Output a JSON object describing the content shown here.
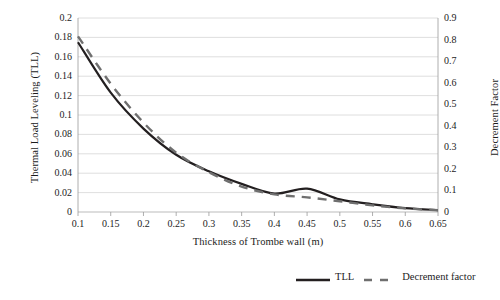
{
  "chart_data": {
    "type": "line",
    "title": "",
    "xlabel": "Thickness of Trombe wall (m)",
    "ylabel": "Thermal Load Leveling (TLL)",
    "y2label": "Decrement Factor",
    "xlim": [
      0.1,
      0.65
    ],
    "ylim": [
      0,
      0.2
    ],
    "y2lim": [
      0,
      0.9
    ],
    "grid": true,
    "legend_position": "bottom-right",
    "xticks": [
      "0.1",
      "0.15",
      "0.2",
      "0.25",
      "0.3",
      "0.35",
      "0.4",
      "0.45",
      "0.5",
      "0.55",
      "0.6",
      "0.65"
    ],
    "yticks_left": [
      "0",
      "0.02",
      "0.04",
      "0.06",
      "0.08",
      "0.1",
      "0.12",
      "0.14",
      "0.16",
      "0.18",
      "0.2"
    ],
    "yticks_right": [
      "0",
      "0.1",
      "0.2",
      "0.3",
      "0.4",
      "0.5",
      "0.6",
      "0.7",
      "0.8",
      "0.9"
    ],
    "x": [
      0.1,
      0.15,
      0.2,
      0.25,
      0.3,
      0.35,
      0.4,
      0.45,
      0.5,
      0.55,
      0.6,
      0.65
    ],
    "series": [
      {
        "name": "TLL",
        "axis": "left",
        "style": "solid",
        "color": "#231f20",
        "values": [
          0.175,
          0.123,
          0.086,
          0.059,
          0.042,
          0.029,
          0.019,
          0.024,
          0.013,
          0.008,
          0.004,
          0.002
        ]
      },
      {
        "name": "Decrement factor",
        "axis": "right",
        "style": "dashed",
        "color": "#6f6f6f",
        "values": [
          0.815,
          0.595,
          0.415,
          0.275,
          0.185,
          0.118,
          0.082,
          0.068,
          0.05,
          0.031,
          0.017,
          0.008
        ]
      }
    ]
  },
  "legend": {
    "items": [
      {
        "label": "TLL"
      },
      {
        "label": "Decrement factor"
      }
    ]
  }
}
